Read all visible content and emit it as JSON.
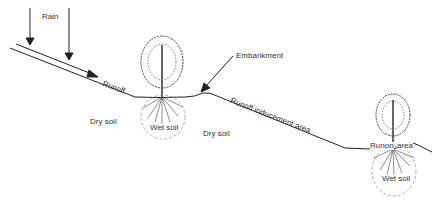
{
  "diagram": {
    "type": "cross-section",
    "labels": {
      "rain": "Rain",
      "runoff": "Runoff",
      "embankment": "Embankment",
      "runoff_inducement_area": "Runoff inducement area",
      "dry_soil_left": "Dry soil",
      "dry_soil_middle": "Dry soil",
      "wet_soil_1": "Wet soil",
      "wet_soil_2": "Wet soil",
      "runon": "Runon",
      "area": "area"
    },
    "colors": {
      "line": "#222222",
      "text": "#333333",
      "dashed": "#888888"
    }
  }
}
